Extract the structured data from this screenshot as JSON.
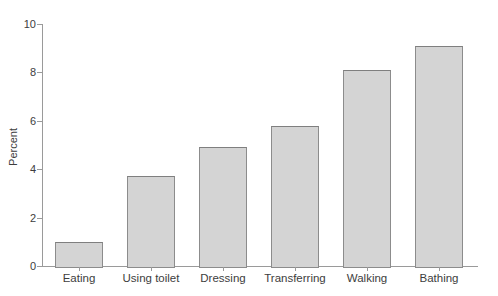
{
  "chart_data": {
    "type": "bar",
    "categories": [
      "Eating",
      "Using toilet",
      "Dressing",
      "Transferring",
      "Walking",
      "Bathing"
    ],
    "values": [
      1.0,
      3.7,
      4.9,
      5.8,
      8.1,
      9.1
    ],
    "title": "",
    "xlabel": "",
    "ylabel": "Percent",
    "ylim": [
      0,
      10
    ],
    "yticks": [
      0,
      2,
      4,
      6,
      8,
      10
    ],
    "grid": false,
    "legend": "none",
    "colors": {
      "bar_fill": "#d4d4d4",
      "bar_border": "#8c8c8c",
      "axis": "#9a9a9a",
      "text": "#3d3d3d",
      "background": "#ffffff"
    }
  }
}
